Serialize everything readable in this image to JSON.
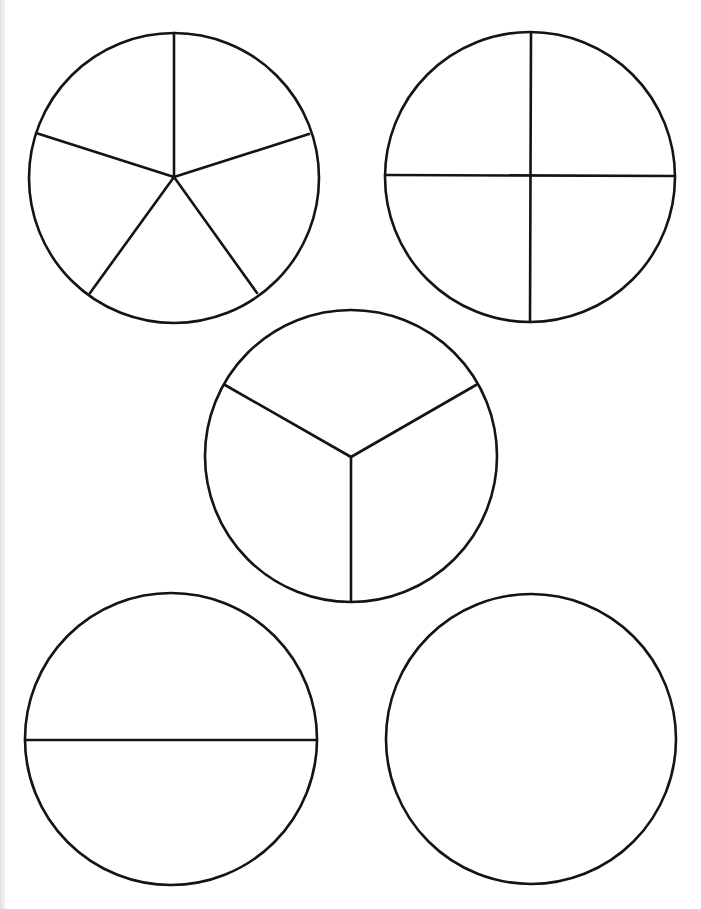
{
  "page": {
    "background": "#ffffff",
    "stroke_color": "#141414",
    "edge_strip_color": "#e6e6e6"
  },
  "circles": [
    {
      "name": "fifths",
      "label": "Circle divided into 5 equal parts",
      "parts": 5,
      "center": [
        174,
        178
      ],
      "radius": 145,
      "dividers": [
        [
          174,
          177,
          174,
          33
        ],
        [
          174,
          177,
          309,
          134
        ],
        [
          174,
          177,
          36,
          133
        ],
        [
          174,
          177,
          90,
          293
        ],
        [
          174,
          177,
          257,
          293
        ]
      ]
    },
    {
      "name": "quarters",
      "label": "Circle divided into 4 equal parts",
      "parts": 4,
      "center": [
        530,
        177
      ],
      "radius": 145,
      "dividers": [
        [
          531,
          33,
          530,
          322
        ],
        [
          385,
          175,
          675,
          176
        ]
      ]
    },
    {
      "name": "thirds",
      "label": "Circle divided into 3 equal parts",
      "parts": 3,
      "center": [
        351,
        456
      ],
      "radius": 146,
      "dividers": [
        [
          351,
          457,
          225,
          385
        ],
        [
          351,
          457,
          476,
          385
        ],
        [
          351,
          457,
          351,
          601
        ]
      ]
    },
    {
      "name": "halves",
      "label": "Circle divided into 2 equal parts",
      "parts": 2,
      "center": [
        171,
        739
      ],
      "radius": 146,
      "dividers": [
        [
          25,
          740,
          317,
          740
        ]
      ]
    },
    {
      "name": "whole",
      "label": "Whole circle (1 part)",
      "parts": 1,
      "center": [
        531,
        739
      ],
      "radius": 145,
      "dividers": []
    }
  ]
}
